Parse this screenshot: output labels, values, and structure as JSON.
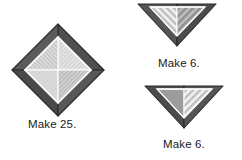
{
  "figure": {
    "background_color": "#ffffff"
  },
  "palette": {
    "border_dark": "#4a4a4a",
    "border_dark_shade": "#555555",
    "outline": "#2b2b2b",
    "fill_light": "#e2e2e2",
    "fill_light_alt": "#d6d6d6",
    "fill_medium": "#a8a8a8",
    "stripe_light_bg": "#efefef",
    "stripe_light_fg": "#b9b9b9",
    "stripe_medium_bg": "#b5b5b5",
    "stripe_medium_fg": "#8f8f8f",
    "text_color": "#1a1a1a"
  },
  "units": [
    {
      "id": "square-in-square",
      "name": "square-in-a-square-block",
      "shape": "diamond",
      "caption": "Make 25.",
      "quantity": 25,
      "patches": [
        {
          "name": "outer-triangle-top",
          "fill": "border_dark"
        },
        {
          "name": "outer-triangle-right",
          "fill": "border_dark"
        },
        {
          "name": "outer-triangle-bottom",
          "fill": "border_dark"
        },
        {
          "name": "outer-triangle-left",
          "fill": "border_dark"
        },
        {
          "name": "inner-quarter-top",
          "fill": "stripe_light"
        },
        {
          "name": "inner-quarter-right",
          "fill": "stripe_medium"
        },
        {
          "name": "inner-quarter-bottom",
          "fill": "stripe_light"
        },
        {
          "name": "inner-quarter-left",
          "fill": "fill_light_alt"
        }
      ]
    },
    {
      "id": "geese-top",
      "name": "flying-geese-unit-a",
      "shape": "downward-triangle",
      "caption": "Make 6.",
      "quantity": 6,
      "patches": [
        {
          "name": "outer-triangle-left",
          "fill": "border_dark"
        },
        {
          "name": "outer-triangle-right",
          "fill": "border_dark"
        },
        {
          "name": "inner-triangle-left",
          "fill": "stripe_light"
        },
        {
          "name": "inner-triangle-right",
          "fill": "stripe_medium"
        }
      ]
    },
    {
      "id": "geese-bottom",
      "name": "flying-geese-unit-b",
      "shape": "downward-triangle",
      "caption": "Make 6.",
      "quantity": 6,
      "patches": [
        {
          "name": "outer-triangle-left",
          "fill": "border_dark"
        },
        {
          "name": "outer-triangle-right",
          "fill": "border_dark"
        },
        {
          "name": "inner-triangle-left",
          "fill": "fill_medium"
        },
        {
          "name": "inner-triangle-right",
          "fill": "stripe_light"
        }
      ]
    }
  ],
  "captions": {
    "square_in_square": "Make 25.",
    "geese_top": "Make 6.",
    "geese_bottom": "Make 6."
  }
}
